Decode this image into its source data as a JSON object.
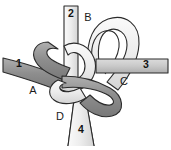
{
  "figure": {
    "background": "#ffffff",
    "width": 171,
    "height": 150
  },
  "colors": {
    "background": "#ffffff",
    "outline": "#2b2b2b",
    "strand_dark": "#8e8e8e",
    "strand_dark_edge": "#6f6f6f",
    "strand_light": "#ededed",
    "strand_light_edge": "#bdbdbd",
    "strand_mid": "#c9c9c9",
    "label_text": "#1a1a1a"
  },
  "endpoint_labels": [
    {
      "id": "endpoint-1",
      "text": "1",
      "x": 19,
      "y": 67,
      "band": "dark",
      "direction": "west"
    },
    {
      "id": "endpoint-2",
      "text": "2",
      "x": 71,
      "y": 17,
      "band": "light",
      "direction": "north"
    },
    {
      "id": "endpoint-3",
      "text": "3",
      "x": 146,
      "y": 68,
      "band": "mid",
      "direction": "east"
    },
    {
      "id": "endpoint-4",
      "text": "4",
      "x": 81,
      "y": 133,
      "band": "light",
      "direction": "south"
    }
  ],
  "region_labels": [
    {
      "id": "region-A",
      "text": "A",
      "x": 33,
      "y": 94
    },
    {
      "id": "region-B",
      "text": "B",
      "x": 88,
      "y": 21
    },
    {
      "id": "region-C",
      "text": "C",
      "x": 124,
      "y": 85
    },
    {
      "id": "region-D",
      "text": "D",
      "x": 60,
      "y": 120
    }
  ],
  "strands": [
    {
      "id": "strand-dark",
      "label": "dark-strand",
      "shade": "dark",
      "ends": [
        "1",
        "4"
      ]
    },
    {
      "id": "strand-light",
      "label": "light-strand",
      "shade": "light",
      "ends": [
        "2",
        "3"
      ]
    }
  ]
}
